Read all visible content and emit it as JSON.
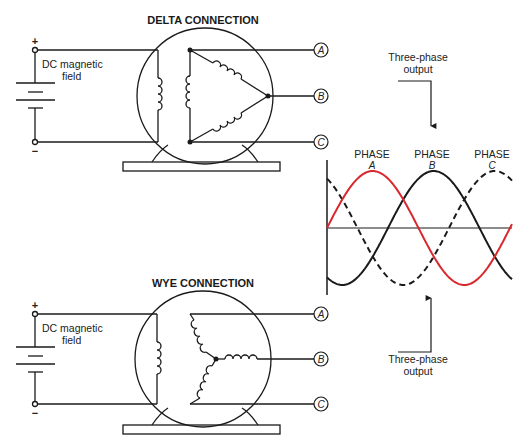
{
  "delta": {
    "title": "DELTA CONNECTION",
    "dc_label_line1": "DC magnetic",
    "dc_label_line2": "field",
    "plus": "+",
    "minus": "−",
    "terminals": [
      "A",
      "B",
      "C"
    ]
  },
  "wye": {
    "title": "WYE CONNECTION",
    "dc_label_line1": "DC magnetic",
    "dc_label_line2": "field",
    "plus": "+",
    "minus": "−",
    "terminals": [
      "A",
      "B",
      "C"
    ]
  },
  "waveform": {
    "top_label_line1": "Three-phase",
    "top_label_line2": "output",
    "bottom_label_line1": "Three-phase",
    "bottom_label_line2": "output",
    "phases": [
      {
        "label": "PHASE",
        "letter": "A",
        "style": "solid",
        "color": "#d9272e"
      },
      {
        "label": "PHASE",
        "letter": "B",
        "style": "solid",
        "color": "#1a1a1a"
      },
      {
        "label": "PHASE",
        "letter": "C",
        "style": "dashed",
        "color": "#1a1a1a"
      }
    ]
  },
  "colors": {
    "line": "#1a1a1a",
    "phase_a": "#d9272e"
  }
}
